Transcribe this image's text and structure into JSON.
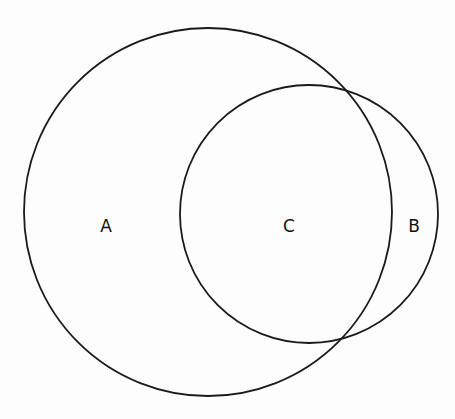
{
  "diagram": {
    "type": "venn",
    "circles": [
      {
        "name": "A",
        "cx": 208,
        "cy": 212,
        "r": 184
      },
      {
        "name": "B",
        "cx": 309,
        "cy": 214,
        "r": 129
      }
    ],
    "labels": [
      {
        "text": "A",
        "x": 106,
        "y": 226
      },
      {
        "text": "C",
        "x": 289,
        "y": 226
      },
      {
        "text": "B",
        "x": 414,
        "y": 226
      }
    ],
    "stroke_color": "#1a1a1a",
    "background": "#fdfdfd"
  }
}
